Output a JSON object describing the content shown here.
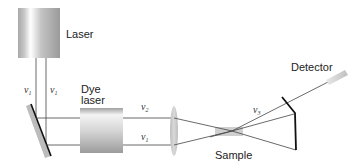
{
  "diagram": {
    "components": {
      "laser": {
        "label": "Laser"
      },
      "dye_laser": {
        "label_line1": "Dye",
        "label_line2": "laser"
      },
      "sample": {
        "label": "Sample"
      },
      "detector": {
        "label": "Detector"
      },
      "lens": {
        "label": ""
      },
      "mirror_left": {
        "label": ""
      },
      "mirror_right": {
        "label": ""
      }
    },
    "beam_labels": {
      "laser_beam_left": {
        "symbol": "ν",
        "sub": "1"
      },
      "laser_beam_right": {
        "symbol": "ν",
        "sub": "1"
      },
      "dye_output": {
        "symbol": "ν",
        "sub": "2"
      },
      "pump_passthrough": {
        "symbol": "ν",
        "sub": "1"
      },
      "signal": {
        "symbol": "ν",
        "sub": "3"
      }
    },
    "colors": {
      "beam": "#444444",
      "mirror": "#111111",
      "component_gray": "#9a9a9a",
      "background": "#ffffff"
    }
  }
}
